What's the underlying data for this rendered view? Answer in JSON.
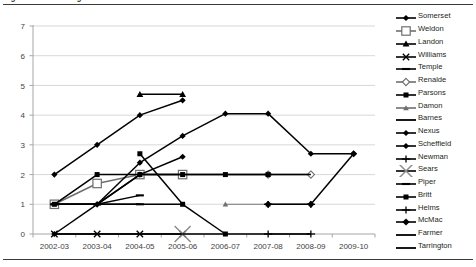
{
  "figure": {
    "caption": "Figure 3. School Progress: Schools that Discontinued"
  },
  "chart_data": {
    "type": "line",
    "title": "Figure 3. School Progress: Schools that Discontinued",
    "xlabel": "",
    "ylabel": "",
    "ylim": [
      0,
      7
    ],
    "yticks": [
      "0",
      "1",
      "2",
      "3",
      "4",
      "5",
      "6",
      "7"
    ],
    "grid": true,
    "legend_position": "right",
    "categories": [
      "2002-03",
      "2003-04",
      "2004-05",
      "2005-06",
      "2006-07",
      "2007-08",
      "2008-09",
      "2009-10"
    ],
    "series": [
      {
        "name": "Somerset",
        "marker": "diamond",
        "values": [
          2,
          3,
          4,
          4.5,
          null,
          null,
          null,
          null
        ]
      },
      {
        "name": "Weldon",
        "marker": "open-square",
        "values": [
          1,
          1.7,
          2,
          2,
          null,
          null,
          null,
          null
        ]
      },
      {
        "name": "Landon",
        "marker": "triangle",
        "values": [
          null,
          null,
          4.7,
          4.7,
          null,
          null,
          null,
          null
        ]
      },
      {
        "name": "Williams",
        "marker": "x",
        "values": [
          0,
          0,
          0,
          0,
          null,
          null,
          null,
          null
        ]
      },
      {
        "name": "Temple",
        "marker": "dash",
        "values": [
          1,
          1,
          1.3,
          null,
          null,
          null,
          null,
          null
        ]
      },
      {
        "name": "Renalde",
        "marker": "open-diamond",
        "values": [
          null,
          null,
          null,
          null,
          null,
          2,
          2,
          null
        ]
      },
      {
        "name": "Parsons",
        "marker": "filled-square",
        "values": [
          1,
          2,
          2,
          2,
          2,
          2,
          null,
          null
        ]
      },
      {
        "name": "Damon",
        "marker": "triangle-small",
        "values": [
          null,
          null,
          null,
          null,
          1,
          1,
          null,
          null
        ]
      },
      {
        "name": "Barnes",
        "marker": "line",
        "values": [
          1,
          1,
          2,
          2,
          2,
          2,
          2,
          null
        ]
      },
      {
        "name": "Nexus",
        "marker": "diamond",
        "values": [
          null,
          1,
          2.4,
          3.3,
          4.05,
          4.05,
          2.7,
          2.7
        ]
      },
      {
        "name": "Scheffield",
        "marker": "diamond",
        "values": [
          0,
          1,
          2,
          2.6,
          null,
          null,
          null,
          null
        ]
      },
      {
        "name": "Newman",
        "marker": "cross",
        "values": [
          null,
          null,
          null,
          null,
          null,
          0,
          0,
          null
        ]
      },
      {
        "name": "Sears",
        "marker": "x-large",
        "values": [
          null,
          null,
          null,
          0,
          null,
          null,
          null,
          null
        ]
      },
      {
        "name": "Piper",
        "marker": "dash",
        "values": [
          1,
          1,
          1,
          null,
          null,
          null,
          null,
          null
        ]
      },
      {
        "name": "Britt",
        "marker": "filled-square",
        "values": [
          null,
          null,
          2.7,
          1,
          0,
          null,
          null,
          null
        ]
      },
      {
        "name": "Helms",
        "marker": "plus",
        "values": [
          null,
          null,
          null,
          null,
          null,
          1,
          1,
          null
        ]
      },
      {
        "name": "McMac",
        "marker": "diamond-bold",
        "values": [
          null,
          null,
          null,
          null,
          null,
          1,
          1,
          2.7
        ]
      },
      {
        "name": "Farmer",
        "marker": "line",
        "values": [
          0,
          0,
          0,
          0,
          0,
          0,
          0,
          null
        ]
      },
      {
        "name": "Tarrington",
        "marker": "line",
        "values": [
          1,
          1,
          1,
          1,
          null,
          null,
          null,
          null
        ]
      }
    ]
  },
  "legend": {
    "items": [
      {
        "label": "Somerset"
      },
      {
        "label": "Weldon"
      },
      {
        "label": "Landon"
      },
      {
        "label": "Williams"
      },
      {
        "label": "Temple"
      },
      {
        "label": "Renalde"
      },
      {
        "label": "Parsons"
      },
      {
        "label": "Damon"
      },
      {
        "label": "Barnes"
      },
      {
        "label": "Nexus"
      },
      {
        "label": "Scheffield"
      },
      {
        "label": "Newman"
      },
      {
        "label": "Sears"
      },
      {
        "label": "Piper"
      },
      {
        "label": "Britt"
      },
      {
        "label": "Helms"
      },
      {
        "label": "McMac"
      },
      {
        "label": "Farmer"
      },
      {
        "label": "Tarrington"
      }
    ]
  },
  "colors": {
    "line": "#000000",
    "grid": "#d4d4d4",
    "axis": "#a6a6a6",
    "text": "#231f20",
    "rule": "#3b3b3b"
  }
}
